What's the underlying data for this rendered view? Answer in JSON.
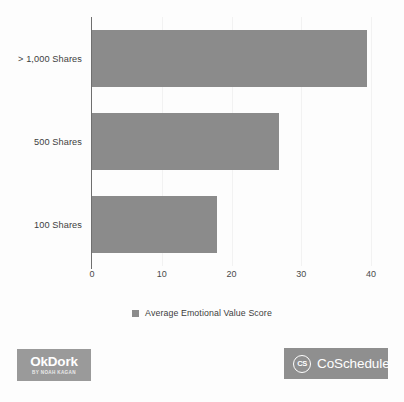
{
  "chart_data": {
    "type": "bar",
    "orientation": "horizontal",
    "title": "",
    "xlabel": "",
    "ylabel": "",
    "categories": [
      "> 1,000 Shares",
      "500 Shares",
      "100 Shares"
    ],
    "values": [
      39.4,
      26.8,
      17.9
    ],
    "series": [
      {
        "name": "Average Emotional Value Score",
        "values": [
          39.4,
          26.8,
          17.9
        ],
        "color": "#8b8b8b"
      }
    ],
    "xlim": [
      0,
      40
    ],
    "xticks": [
      0,
      10,
      20,
      30,
      40
    ],
    "xtick_labels": [
      "0",
      "10",
      "20",
      "30",
      "40"
    ],
    "grid": true,
    "grid_axis": "x",
    "legend_position": "bottom",
    "legend_entries": [
      {
        "label": "Average Emotional Value Score",
        "color": "#8b8b8b"
      }
    ]
  },
  "legend": {
    "swatch_name": "legend-color-swatch",
    "label": "Average Emotional Value Score"
  },
  "footer": {
    "okdork": {
      "wordmark": "OkDork",
      "tagline": "BY NOAH KAGAN",
      "background": "#9a9a9a"
    },
    "coschedule": {
      "mark_text": "CS",
      "wordmark": "CoSchedule",
      "background": "#8f8f8f"
    }
  },
  "colors": {
    "bar": "#8b8b8b",
    "axis": "#6f6f6f",
    "gridline": "#f2f2f2",
    "text": "#3d3d3d",
    "page_background": "#fdfdfd"
  }
}
